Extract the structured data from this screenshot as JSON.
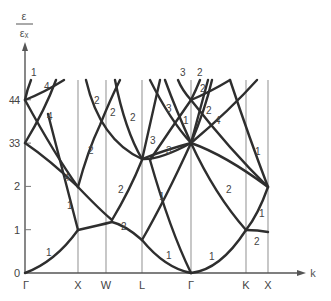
{
  "diagram": {
    "y_axis": {
      "label_numerator": "ε",
      "label_denominator": "εₓ",
      "ticks": [
        "0",
        "1",
        "2",
        "3",
        "4"
      ]
    },
    "x_axis": {
      "label": "k",
      "points": [
        "Γ",
        "X",
        "W",
        "L",
        "Γ",
        "K",
        "X"
      ]
    },
    "degeneracy_labels": [
      {
        "text": "1",
        "region": "Γ-X upper"
      },
      {
        "text": "4",
        "region": "Γ-X top"
      },
      {
        "text": "4",
        "region": "Γ-X mid"
      },
      {
        "text": "4",
        "region": "Γ-X near X"
      },
      {
        "text": "4",
        "region": "Γ axis"
      },
      {
        "text": "3",
        "region": "Γ axis"
      },
      {
        "text": "1",
        "region": "Γ-X lower"
      },
      {
        "text": "1",
        "region": "Γ-X bottom"
      },
      {
        "text": "2",
        "region": "X-W upper"
      },
      {
        "text": "2",
        "region": "X-W mid"
      },
      {
        "text": "2",
        "region": "W-L upper"
      },
      {
        "text": "2",
        "region": "W-L upper2"
      },
      {
        "text": "2",
        "region": "W-L mid"
      },
      {
        "text": "2",
        "region": "W-L lower"
      },
      {
        "text": "3",
        "region": "L-Γ upper"
      },
      {
        "text": "3",
        "region": "L-Γ mid"
      },
      {
        "text": "3",
        "region": "L-Γ lower"
      },
      {
        "text": "1",
        "region": "L-Γ near Γ"
      },
      {
        "text": "1",
        "region": "L-Γ lower"
      },
      {
        "text": "1",
        "region": "L-Γ bottom"
      },
      {
        "text": "3",
        "region": "Γ top"
      },
      {
        "text": "2",
        "region": "Γ-K top"
      },
      {
        "text": "2",
        "region": "Γ-K upper"
      },
      {
        "text": "2",
        "region": "Γ-K upper2"
      },
      {
        "text": "4",
        "region": "Γ-K mid"
      },
      {
        "text": "2",
        "region": "Γ-K lower"
      },
      {
        "text": "1",
        "region": "Γ-K bottom"
      },
      {
        "text": "1",
        "region": "K-X upper"
      },
      {
        "text": "1",
        "region": "K-X lower"
      },
      {
        "text": "2",
        "region": "K-X bottom"
      }
    ]
  }
}
